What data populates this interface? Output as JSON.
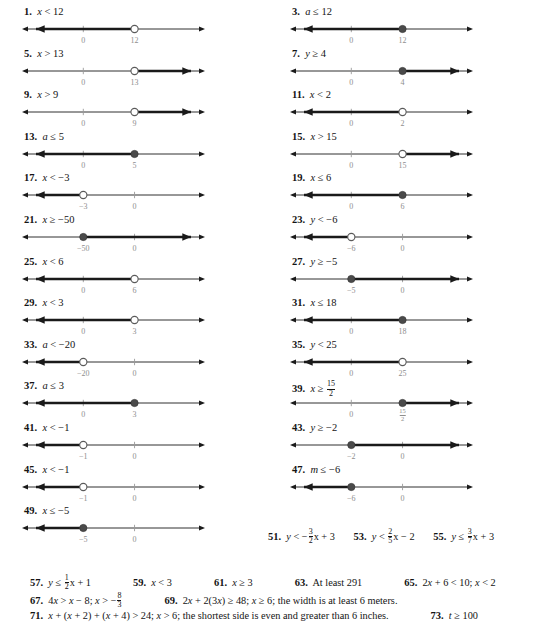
{
  "page": {
    "type": "answer-key",
    "columns": 2
  },
  "colors": {
    "ink": "#141414",
    "tick_label": "#8e8e8e",
    "ray": "#1a1a1a"
  },
  "left_column": [
    {
      "number": "1.",
      "expression": "x < 12",
      "var": "x",
      "op": "<",
      "value": "12",
      "graph": {
        "type": "number-line",
        "endpoint": "open",
        "direction": "left",
        "ticks": [
          {
            "label": "0",
            "pos": 0.335
          },
          {
            "label": "12",
            "pos": 0.615
          }
        ],
        "point_pos": 0.615
      }
    },
    {
      "number": "5.",
      "expression": "x > 13",
      "var": "x",
      "op": ">",
      "value": "13",
      "graph": {
        "type": "number-line",
        "endpoint": "open",
        "direction": "right",
        "ticks": [
          {
            "label": "0",
            "pos": 0.335
          },
          {
            "label": "13",
            "pos": 0.615
          }
        ],
        "point_pos": 0.615
      }
    },
    {
      "number": "9.",
      "expression": "x > 9",
      "var": "x",
      "op": ">",
      "value": "9",
      "graph": {
        "type": "number-line",
        "endpoint": "open",
        "direction": "right",
        "ticks": [
          {
            "label": "0",
            "pos": 0.335
          },
          {
            "label": "9",
            "pos": 0.615
          }
        ],
        "point_pos": 0.615
      }
    },
    {
      "number": "13.",
      "expression": "a ≤ 5",
      "var": "a",
      "op": "≤",
      "value": "5",
      "graph": {
        "type": "number-line",
        "endpoint": "closed",
        "direction": "left",
        "ticks": [
          {
            "label": "0",
            "pos": 0.335
          },
          {
            "label": "5",
            "pos": 0.615
          }
        ],
        "point_pos": 0.615
      }
    },
    {
      "number": "17.",
      "expression": "x < −3",
      "var": "x",
      "op": "<",
      "value": "−3",
      "graph": {
        "type": "number-line",
        "endpoint": "open",
        "direction": "left",
        "ticks": [
          {
            "label": "−3",
            "pos": 0.335
          },
          {
            "label": "0",
            "pos": 0.615
          }
        ],
        "point_pos": 0.335
      }
    },
    {
      "number": "21.",
      "expression": "x ≥ −50",
      "var": "x",
      "op": "≥",
      "value": "−50",
      "graph": {
        "type": "number-line",
        "endpoint": "closed",
        "direction": "right",
        "ticks": [
          {
            "label": "−50",
            "pos": 0.335
          },
          {
            "label": "0",
            "pos": 0.615
          }
        ],
        "point_pos": 0.335
      }
    },
    {
      "number": "25.",
      "expression": "x < 6",
      "var": "x",
      "op": "<",
      "value": "6",
      "graph": {
        "type": "number-line",
        "endpoint": "open",
        "direction": "left",
        "ticks": [
          {
            "label": "0",
            "pos": 0.335
          },
          {
            "label": "6",
            "pos": 0.615
          }
        ],
        "point_pos": 0.615
      }
    },
    {
      "number": "29.",
      "expression": "x < 3",
      "var": "x",
      "op": "<",
      "value": "3",
      "graph": {
        "type": "number-line",
        "endpoint": "open",
        "direction": "left",
        "ticks": [
          {
            "label": "0",
            "pos": 0.335
          },
          {
            "label": "3",
            "pos": 0.615
          }
        ],
        "point_pos": 0.615
      }
    },
    {
      "number": "33.",
      "expression": "a < −20",
      "var": "a",
      "op": "<",
      "value": "−20",
      "graph": {
        "type": "number-line",
        "endpoint": "open",
        "direction": "left",
        "ticks": [
          {
            "label": "−20",
            "pos": 0.335
          },
          {
            "label": "0",
            "pos": 0.615
          }
        ],
        "point_pos": 0.335
      }
    },
    {
      "number": "37.",
      "expression": "a ≤ 3",
      "var": "a",
      "op": "≤",
      "value": "3",
      "graph": {
        "type": "number-line",
        "endpoint": "closed",
        "direction": "left",
        "ticks": [
          {
            "label": "0",
            "pos": 0.335
          },
          {
            "label": "3",
            "pos": 0.615
          }
        ],
        "point_pos": 0.615
      }
    },
    {
      "number": "41.",
      "expression": "x < −1",
      "var": "x",
      "op": "<",
      "value": "−1",
      "graph": {
        "type": "number-line",
        "endpoint": "open",
        "direction": "left",
        "ticks": [
          {
            "label": "−1",
            "pos": 0.335
          },
          {
            "label": "0",
            "pos": 0.615
          }
        ],
        "point_pos": 0.335
      }
    },
    {
      "number": "45.",
      "expression": "x < −1",
      "var": "x",
      "op": "<",
      "value": "−1",
      "graph": {
        "type": "number-line",
        "endpoint": "open",
        "direction": "left",
        "ticks": [
          {
            "label": "−1",
            "pos": 0.335
          },
          {
            "label": "0",
            "pos": 0.615
          }
        ],
        "point_pos": 0.335
      }
    },
    {
      "number": "49.",
      "expression": "x ≤ −5",
      "var": "x",
      "op": "≤",
      "value": "−5",
      "graph": {
        "type": "number-line",
        "endpoint": "closed",
        "direction": "left",
        "ticks": [
          {
            "label": "−5",
            "pos": 0.335
          },
          {
            "label": "0",
            "pos": 0.615
          }
        ],
        "point_pos": 0.335
      }
    }
  ],
  "right_column": [
    {
      "number": "3.",
      "expression": "a ≤ 12",
      "var": "a",
      "op": "≤",
      "value": "12",
      "graph": {
        "type": "number-line",
        "endpoint": "closed",
        "direction": "left",
        "ticks": [
          {
            "label": "0",
            "pos": 0.335
          },
          {
            "label": "12",
            "pos": 0.615
          }
        ],
        "point_pos": 0.615
      }
    },
    {
      "number": "7.",
      "expression": "y ≥ 4",
      "var": "y",
      "op": "≥",
      "value": "4",
      "graph": {
        "type": "number-line",
        "endpoint": "closed",
        "direction": "right",
        "ticks": [
          {
            "label": "0",
            "pos": 0.335
          },
          {
            "label": "4",
            "pos": 0.615
          }
        ],
        "point_pos": 0.615
      }
    },
    {
      "number": "11.",
      "expression": "x < 2",
      "var": "x",
      "op": "<",
      "value": "2",
      "graph": {
        "type": "number-line",
        "endpoint": "open",
        "direction": "left",
        "ticks": [
          {
            "label": "0",
            "pos": 0.335
          },
          {
            "label": "2",
            "pos": 0.615
          }
        ],
        "point_pos": 0.615
      }
    },
    {
      "number": "15.",
      "expression": "x > 15",
      "var": "x",
      "op": ">",
      "value": "15",
      "graph": {
        "type": "number-line",
        "endpoint": "open",
        "direction": "right",
        "ticks": [
          {
            "label": "0",
            "pos": 0.335
          },
          {
            "label": "15",
            "pos": 0.615
          }
        ],
        "point_pos": 0.615
      }
    },
    {
      "number": "19.",
      "expression": "x ≤ 6",
      "var": "x",
      "op": "≤",
      "value": "6",
      "graph": {
        "type": "number-line",
        "endpoint": "closed",
        "direction": "left",
        "ticks": [
          {
            "label": "0",
            "pos": 0.335
          },
          {
            "label": "6",
            "pos": 0.615
          }
        ],
        "point_pos": 0.615
      }
    },
    {
      "number": "23.",
      "expression": "y < −6",
      "var": "y",
      "op": "<",
      "value": "−6",
      "graph": {
        "type": "number-line",
        "endpoint": "open",
        "direction": "left",
        "ticks": [
          {
            "label": "−6",
            "pos": 0.335
          },
          {
            "label": "0",
            "pos": 0.615
          }
        ],
        "point_pos": 0.335
      }
    },
    {
      "number": "27.",
      "expression": "y ≥ −5",
      "var": "y",
      "op": "≥",
      "value": "−5",
      "graph": {
        "type": "number-line",
        "endpoint": "closed",
        "direction": "right",
        "ticks": [
          {
            "label": "−5",
            "pos": 0.335
          },
          {
            "label": "0",
            "pos": 0.615
          }
        ],
        "point_pos": 0.335
      }
    },
    {
      "number": "31.",
      "expression": "x ≤ 18",
      "var": "x",
      "op": "≤",
      "value": "18",
      "graph": {
        "type": "number-line",
        "endpoint": "closed",
        "direction": "left",
        "ticks": [
          {
            "label": "0",
            "pos": 0.335
          },
          {
            "label": "18",
            "pos": 0.615
          }
        ],
        "point_pos": 0.615
      }
    },
    {
      "number": "35.",
      "expression": "y < 25",
      "var": "y",
      "op": "<",
      "value": "25",
      "graph": {
        "type": "number-line",
        "endpoint": "open",
        "direction": "left",
        "ticks": [
          {
            "label": "0",
            "pos": 0.335
          },
          {
            "label": "25",
            "pos": 0.615
          }
        ],
        "point_pos": 0.615
      }
    },
    {
      "number": "39.",
      "expression": "x ≥ 15/2",
      "var": "x",
      "op": "≥",
      "value_fraction": {
        "numerator": "15",
        "denominator": "2"
      },
      "graph": {
        "type": "number-line",
        "endpoint": "closed",
        "direction": "right",
        "ticks": [
          {
            "label": "0",
            "pos": 0.335
          },
          {
            "label_fraction": {
              "numerator": "15",
              "denominator": "2"
            },
            "pos": 0.615
          }
        ],
        "point_pos": 0.615
      }
    },
    {
      "number": "43.",
      "expression": "y ≥ −2",
      "var": "y",
      "op": "≥",
      "value": "−2",
      "graph": {
        "type": "number-line",
        "endpoint": "closed",
        "direction": "right",
        "ticks": [
          {
            "label": "−2",
            "pos": 0.335
          },
          {
            "label": "0",
            "pos": 0.615
          }
        ],
        "point_pos": 0.335
      }
    },
    {
      "number": "47.",
      "expression": "m ≤ −6",
      "var": "m",
      "op": "≤",
      "value": "−6",
      "graph": {
        "type": "number-line",
        "endpoint": "closed",
        "direction": "left",
        "ticks": [
          {
            "label": "−6",
            "pos": 0.335
          },
          {
            "label": "0",
            "pos": 0.615
          }
        ],
        "point_pos": 0.335
      }
    }
  ],
  "inline_answers_row": [
    {
      "number": "51.",
      "text": "y < −(3/2)x + 3"
    },
    {
      "number": "53.",
      "text": "y < (2/5)x − 2"
    },
    {
      "number": "55.",
      "text": "y ≤ (3/7)x + 3"
    }
  ],
  "bottom_answers": {
    "row1": [
      {
        "number": "57.",
        "text": "y ≤ (1/2)x + 1"
      },
      {
        "number": "59.",
        "text": "x < 3"
      },
      {
        "number": "61.",
        "text": "x ≥ 3"
      },
      {
        "number": "63.",
        "text": "At least 291"
      },
      {
        "number": "65.",
        "text": "2x + 6 < 10; x < 2"
      }
    ],
    "row2": [
      {
        "number": "67.",
        "text": "4x > x − 8; x > −(8/3)"
      },
      {
        "number": "69.",
        "text": "2x + 2(3x) ≥ 48; x ≥ 6; the width is at least 6 meters."
      }
    ],
    "row3": [
      {
        "number": "71.",
        "text": "x + (x + 2) + (x + 4) > 24; x > 6; the shortest side is even and greater than 6 inches."
      },
      {
        "number": "73.",
        "text": "t ≥ 100"
      }
    ]
  }
}
